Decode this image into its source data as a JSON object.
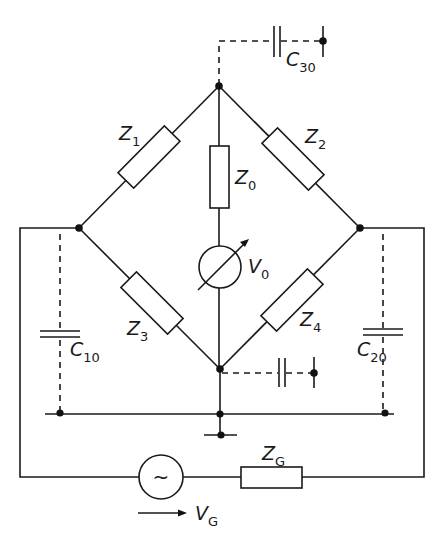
{
  "diagram": {
    "type": "AC impedance bridge circuit with stray capacitances",
    "labels": {
      "z1": {
        "main": "Z",
        "sub": "1"
      },
      "z2": {
        "main": "Z",
        "sub": "2"
      },
      "z3": {
        "main": "Z",
        "sub": "3"
      },
      "z4": {
        "main": "Z",
        "sub": "4"
      },
      "z0": {
        "main": "Z",
        "sub": "0"
      },
      "zg": {
        "main": "Z",
        "sub": "G"
      },
      "v0": {
        "main": "V",
        "sub": "0"
      },
      "vg": {
        "main": "V",
        "sub": "G"
      },
      "c10": {
        "main": "C",
        "sub": "10"
      },
      "c20": {
        "main": "C",
        "sub": "20"
      },
      "c30": {
        "main": "C",
        "sub": "30"
      }
    },
    "source_symbol": "~",
    "components": [
      {
        "id": "Z1",
        "kind": "impedance",
        "between": [
          "top",
          "left"
        ]
      },
      {
        "id": "Z2",
        "kind": "impedance",
        "between": [
          "top",
          "right"
        ]
      },
      {
        "id": "Z3",
        "kind": "impedance",
        "between": [
          "left",
          "bottom"
        ]
      },
      {
        "id": "Z4",
        "kind": "impedance",
        "between": [
          "right",
          "bottom"
        ]
      },
      {
        "id": "Z0",
        "kind": "impedance",
        "between": [
          "top",
          "detector"
        ]
      },
      {
        "id": "V0",
        "kind": "voltmeter-detector",
        "between": [
          "Z0",
          "bottom"
        ]
      },
      {
        "id": "ZG",
        "kind": "impedance",
        "between": [
          "source",
          "right-loop"
        ]
      },
      {
        "id": "VG",
        "kind": "ac-source",
        "between": [
          "left-loop",
          "ZG"
        ]
      },
      {
        "id": "C10",
        "kind": "stray-capacitance",
        "between": [
          "left",
          "ground-bus"
        ]
      },
      {
        "id": "C20",
        "kind": "stray-capacitance",
        "between": [
          "right",
          "ground-bus"
        ]
      },
      {
        "id": "C30",
        "kind": "stray-capacitance",
        "between": [
          "top",
          "ground"
        ]
      },
      {
        "id": "C_bottom",
        "kind": "stray-capacitance",
        "between": [
          "bottom",
          "ground"
        ]
      }
    ],
    "colors": {
      "ink": "#1a1a1a",
      "background": "#ffffff"
    }
  }
}
